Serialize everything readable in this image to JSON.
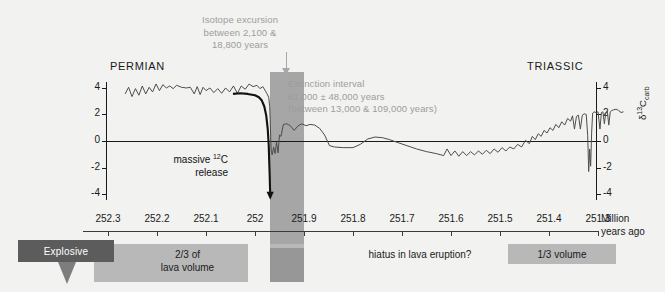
{
  "figure": {
    "period_left": "PERMIAN",
    "period_right": "TRIASSIC"
  },
  "annotations": {
    "isotope_excursion": "Isotope excursion\nbetween 2,100 &\n18,800 years",
    "isotope_excursion_lines": [
      "Isotope excursion",
      "between 2,100 &",
      "18,800 years"
    ],
    "extinction_interval_lines": [
      "Extinction interval",
      "61,000 ± 48,000 years",
      "(between 13,000 & 109,000 years)"
    ],
    "massive_release_line1": "massive ",
    "massive_release_sup": "12",
    "massive_release_line1b": "C",
    "massive_release_line2": "release"
  },
  "axes": {
    "y_label_main": "δ",
    "y_label_sup": "13",
    "y_label_mid": "C",
    "y_label_sub": "carb",
    "y_ticks": [
      "4",
      "2",
      "0",
      "-2",
      "-4"
    ],
    "y_ticks_values": [
      4,
      2,
      0,
      -2,
      -4
    ],
    "y_range": [
      -4.6,
      4.6
    ],
    "x_ticks": [
      "252.3",
      "252.2",
      "252.1",
      "252",
      "251.9",
      "251.8",
      "251.7",
      "251.6",
      "251.5",
      "251.4",
      "251.3"
    ],
    "x_ticks_values": [
      252.3,
      252.2,
      252.1,
      252.0,
      251.9,
      251.8,
      251.7,
      251.6,
      251.5,
      251.4,
      251.3
    ],
    "x_units_line1": "Million",
    "x_units_line2": "years ago",
    "x_range": [
      252.3,
      251.3
    ]
  },
  "volcanism": {
    "explosive_label": "Explosive",
    "two_thirds_label_line1": "2/3 of",
    "two_thirds_label_line2": "lava volume",
    "hiatus_label": "hiatus in lava eruption?",
    "one_third_label": "1/3 volume"
  },
  "colors": {
    "background": "#f2f2f0",
    "band": "#a6a6a6",
    "bar_light": "#b8b8b8",
    "bar_dark": "#5c5c5c",
    "annotation_text": "#9d9d9d",
    "curve": "#4d4d4d",
    "curve_bold": "#111111"
  },
  "chart_data": {
    "type": "line",
    "title": "",
    "subtitle": "",
    "xlabel": "Million years ago",
    "ylabel": "δ13Ccarb",
    "xlim": [
      252.3,
      251.3
    ],
    "ylim": [
      -4.6,
      4.6
    ],
    "x_reversed": true,
    "grid": false,
    "legend": "none",
    "bands": [
      {
        "name": "isotope-excursion-band",
        "x_start": 251.97,
        "x_end": 251.9,
        "color": "#a6a6a6",
        "label": "Isotope excursion between 2,100 & 18,800 years"
      }
    ],
    "series": [
      {
        "name": "d13C_carb",
        "color": "#4d4d4d",
        "points": [
          [
            252.265,
            3.55
          ],
          [
            252.258,
            4.05
          ],
          [
            252.251,
            3.35
          ],
          [
            252.244,
            3.95
          ],
          [
            252.237,
            3.45
          ],
          [
            252.23,
            4.15
          ],
          [
            252.223,
            3.55
          ],
          [
            252.216,
            4.05
          ],
          [
            252.209,
            3.7
          ],
          [
            252.202,
            4.3
          ],
          [
            252.195,
            3.8
          ],
          [
            252.188,
            4.25
          ],
          [
            252.181,
            4.0
          ],
          [
            252.174,
            4.15
          ],
          [
            252.167,
            3.95
          ],
          [
            252.16,
            4.2
          ],
          [
            252.15,
            4.05
          ],
          [
            252.14,
            4.0
          ],
          [
            252.132,
            4.05
          ],
          [
            252.124,
            3.55
          ],
          [
            252.118,
            4.1
          ],
          [
            252.112,
            3.5
          ],
          [
            252.106,
            4.05
          ],
          [
            252.1,
            3.8
          ],
          [
            252.092,
            4.0
          ],
          [
            252.084,
            3.65
          ],
          [
            252.076,
            3.95
          ],
          [
            252.068,
            3.6
          ],
          [
            252.06,
            4.0
          ],
          [
            252.052,
            3.7
          ],
          [
            252.044,
            4.15
          ],
          [
            252.036,
            3.6
          ],
          [
            252.028,
            4.15
          ],
          [
            252.02,
            3.9
          ],
          [
            252.012,
            4.3
          ],
          [
            252.004,
            4.1
          ],
          [
            251.996,
            4.2
          ],
          [
            251.99,
            3.95
          ],
          [
            251.984,
            4.1
          ],
          [
            251.98,
            3.85
          ],
          [
            251.976,
            3.6
          ],
          [
            251.972,
            3.3
          ],
          [
            251.97,
            2.6
          ],
          [
            251.969,
            1.6
          ],
          [
            251.968,
            0.3
          ],
          [
            251.967,
            -0.7
          ],
          [
            251.965,
            -1.05
          ],
          [
            251.962,
            -0.45
          ],
          [
            251.959,
            -0.95
          ],
          [
            251.956,
            -0.1
          ],
          [
            251.953,
            -0.9
          ],
          [
            251.95,
            0.45
          ],
          [
            251.947,
            0.35
          ],
          [
            251.942,
            1.25
          ],
          [
            251.935,
            1.3
          ],
          [
            251.928,
            1.15
          ],
          [
            251.92,
            0.8
          ],
          [
            251.912,
            1.15
          ],
          [
            251.904,
            1.3
          ],
          [
            251.896,
            1.15
          ],
          [
            251.888,
            1.25
          ],
          [
            251.878,
            1.2
          ],
          [
            251.868,
            0.95
          ],
          [
            251.858,
            0.45
          ],
          [
            251.848,
            -0.35
          ],
          [
            251.838,
            -0.45
          ],
          [
            251.82,
            -0.5
          ],
          [
            251.8,
            -0.5
          ],
          [
            251.785,
            -0.25
          ],
          [
            251.77,
            0.15
          ],
          [
            251.755,
            0.3
          ],
          [
            251.74,
            0.25
          ],
          [
            251.725,
            0.1
          ],
          [
            251.71,
            -0.1
          ],
          [
            251.69,
            -0.35
          ],
          [
            251.67,
            -0.6
          ],
          [
            251.65,
            -0.8
          ],
          [
            251.63,
            -0.95
          ],
          [
            251.615,
            -1.1
          ],
          [
            251.608,
            -0.6
          ],
          [
            251.6,
            -1.1
          ],
          [
            251.592,
            -0.75
          ],
          [
            251.584,
            -1.15
          ],
          [
            251.576,
            -0.8
          ],
          [
            251.568,
            -1.1
          ],
          [
            251.56,
            -0.8
          ],
          [
            251.552,
            -1.05
          ],
          [
            251.544,
            -0.75
          ],
          [
            251.536,
            -1.0
          ],
          [
            251.528,
            -0.7
          ],
          [
            251.52,
            -0.95
          ],
          [
            251.512,
            -0.6
          ],
          [
            251.504,
            -0.85
          ],
          [
            251.496,
            -0.5
          ],
          [
            251.488,
            -0.75
          ],
          [
            251.48,
            -0.45
          ],
          [
            251.472,
            -0.6
          ],
          [
            251.464,
            -0.25
          ],
          [
            251.456,
            -0.45
          ],
          [
            251.448,
            0.05
          ],
          [
            251.44,
            -0.2
          ],
          [
            251.434,
            0.35
          ],
          [
            251.428,
            0.1
          ],
          [
            251.422,
            0.55
          ],
          [
            251.416,
            0.35
          ],
          [
            251.41,
            0.8
          ],
          [
            251.404,
            0.6
          ],
          [
            251.398,
            1.0
          ],
          [
            251.392,
            0.8
          ],
          [
            251.386,
            1.25
          ],
          [
            251.38,
            1.0
          ],
          [
            251.374,
            1.45
          ],
          [
            251.368,
            1.2
          ],
          [
            251.362,
            1.7
          ],
          [
            251.356,
            1.5
          ],
          [
            251.352,
            1.9
          ],
          [
            251.348,
            0.9
          ],
          [
            251.344,
            1.85
          ],
          [
            251.34,
            1.95
          ],
          [
            251.336,
            0.9
          ],
          [
            251.332,
            1.95
          ],
          [
            251.328,
            2.05
          ],
          [
            251.324,
            2.0
          ],
          [
            251.321,
            0.4
          ],
          [
            251.319,
            -2.3
          ],
          [
            251.317,
            -0.6
          ],
          [
            251.315,
            -1.9
          ],
          [
            251.313,
            0.6
          ],
          [
            251.311,
            2.1
          ],
          [
            251.308,
            2.2
          ],
          [
            251.304,
            2.15
          ],
          [
            251.3,
            2.2
          ],
          [
            251.296,
            0.9
          ],
          [
            251.293,
            2.15
          ],
          [
            251.29,
            2.2
          ],
          [
            251.287,
            1.3
          ],
          [
            251.284,
            2.15
          ],
          [
            251.281,
            2.25
          ],
          [
            251.278,
            1.2
          ],
          [
            251.275,
            2.2
          ],
          [
            251.272,
            2.3
          ],
          [
            251.268,
            2.35
          ],
          [
            251.263,
            2.4
          ],
          [
            251.258,
            2.3
          ],
          [
            251.253,
            2.15
          ],
          [
            251.248,
            2.2
          ]
        ]
      },
      {
        "name": "massive-12C-release-curve",
        "color": "#111111",
        "points": [
          [
            252.045,
            3.55
          ],
          [
            252.03,
            3.6
          ],
          [
            252.015,
            3.55
          ],
          [
            252.0,
            3.45
          ],
          [
            251.992,
            3.3
          ],
          [
            251.986,
            3.05
          ],
          [
            251.981,
            2.6
          ],
          [
            251.977,
            1.9
          ],
          [
            251.974,
            0.9
          ],
          [
            251.972,
            -0.3
          ],
          [
            251.971,
            -1.5
          ],
          [
            251.97,
            -2.6
          ],
          [
            251.9695,
            -3.4
          ],
          [
            251.969,
            -3.9
          ]
        ]
      }
    ],
    "annotations": [
      {
        "text": "PERMIAN",
        "x": 252.17,
        "y": 5.1
      },
      {
        "text": "TRIASSIC",
        "x": 251.36,
        "y": 5.1
      },
      {
        "text": "massive 12C release",
        "x": 252.03,
        "y": -1.3
      },
      {
        "text": "Isotope excursion between 2,100 & 18,800 years",
        "x": 251.975,
        "y": 7.5
      },
      {
        "text": "Extinction interval 61,000 ± 48,000 years (between 13,000 & 109,000 years)",
        "x": 251.86,
        "y": 4.3
      }
    ]
  }
}
